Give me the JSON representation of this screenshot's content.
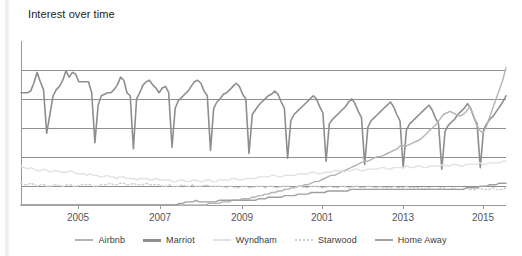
{
  "panel": {
    "title": "Interest over time",
    "background": "#ffffff"
  },
  "legend": {
    "position": "bottom-center",
    "items": [
      {
        "label": "Airbnb",
        "color": "#b4b4b4",
        "style": "solid",
        "width": 2.5,
        "swatch_name": "legend-swatch-airbnb"
      },
      {
        "label": "Marriot",
        "color": "#8e8e8e",
        "style": "solid",
        "width": 3.0,
        "swatch_name": "legend-swatch-marriot"
      },
      {
        "label": "Wyndham",
        "color": "#e2e2e2",
        "style": "solid",
        "width": 2.5,
        "swatch_name": "legend-swatch-wyndham"
      },
      {
        "label": "Starwood",
        "color": "#cfcfcf",
        "style": "dotted",
        "width": 2.5,
        "swatch_name": "legend-swatch-starwood"
      },
      {
        "label": "Home Away",
        "color": "#9f9f9f",
        "style": "solid",
        "width": 2.5,
        "swatch_name": "legend-swatch-homeaway"
      }
    ]
  },
  "axis": {
    "x_tick_labels": [
      "2005",
      "2007",
      "2009",
      "2001",
      "2013",
      "2015"
    ],
    "x_tick_positions": [
      78,
      160,
      242,
      322,
      403,
      483
    ],
    "gridlines_y": [
      70,
      99,
      128,
      157,
      186
    ],
    "baseline_y": 205,
    "axis_color": "#9a9a9a",
    "grid_color": "#8f8f8f"
  },
  "chart_data": {
    "type": "line",
    "title": "Interest over time",
    "xlabel": "",
    "ylabel": "",
    "grid": true,
    "legend_position": "bottom",
    "ylim": [
      0,
      100
    ],
    "xlim": [
      "2004",
      "2016"
    ],
    "x_tick_labels": [
      "2005",
      "2007",
      "2009",
      "2001",
      "2013",
      "2015"
    ],
    "series": [
      {
        "name": "Marriot",
        "color": "#8e8e8e",
        "style": "solid",
        "values": [
          72,
          72,
          72,
          73,
          78,
          85,
          79,
          74,
          46,
          58,
          70,
          74,
          76,
          80,
          86,
          82,
          85,
          84,
          79,
          79,
          79,
          79,
          72,
          40,
          64,
          70,
          71,
          72,
          72,
          74,
          77,
          82,
          80,
          72,
          70,
          36,
          68,
          72,
          77,
          79,
          80,
          77,
          75,
          72,
          75,
          76,
          72,
          37,
          62,
          67,
          69,
          71,
          73,
          76,
          79,
          80,
          78,
          73,
          70,
          35,
          62,
          66,
          68,
          71,
          72,
          74,
          76,
          78,
          76,
          71,
          68,
          33,
          58,
          61,
          64,
          66,
          68,
          70,
          71,
          73,
          71,
          66,
          62,
          30,
          54,
          58,
          60,
          62,
          64,
          66,
          68,
          70,
          68,
          63,
          59,
          28,
          52,
          55,
          57,
          59,
          61,
          63,
          66,
          68,
          65,
          60,
          56,
          26,
          50,
          54,
          56,
          58,
          60,
          62,
          64,
          66,
          63,
          58,
          54,
          24,
          48,
          52,
          54,
          56,
          58,
          60,
          62,
          64,
          61,
          56,
          52,
          23,
          47,
          51,
          53,
          55,
          58,
          60,
          62,
          65,
          62,
          56,
          52,
          24,
          48,
          52,
          55,
          57,
          60,
          63,
          66,
          70
        ]
      },
      {
        "name": "Airbnb",
        "color": "#b4b4b4",
        "style": "solid",
        "values": [
          0,
          0,
          0,
          0,
          0,
          0,
          0,
          0,
          0,
          0,
          0,
          0,
          0,
          0,
          0,
          0,
          0,
          0,
          0,
          0,
          0,
          0,
          0,
          0,
          0,
          0,
          0,
          0,
          0,
          0,
          0,
          0,
          0,
          0,
          0,
          0,
          0,
          0,
          0,
          0,
          0,
          0,
          0,
          0,
          0,
          0,
          0,
          0,
          0,
          0,
          0,
          0,
          0,
          0,
          0,
          0,
          0,
          1,
          1,
          1,
          1,
          2,
          2,
          2,
          3,
          3,
          3,
          4,
          4,
          4,
          5,
          5,
          6,
          6,
          7,
          7,
          8,
          8,
          9,
          9,
          10,
          10,
          11,
          11,
          12,
          12,
          13,
          13,
          14,
          15,
          15,
          16,
          17,
          18,
          19,
          19,
          20,
          21,
          22,
          23,
          24,
          25,
          26,
          27,
          28,
          28,
          29,
          30,
          31,
          31,
          32,
          33,
          34,
          35,
          36,
          38,
          38,
          38,
          39,
          40,
          41,
          42,
          44,
          46,
          48,
          50,
          52,
          55,
          58,
          59,
          60,
          59,
          58,
          57,
          58,
          60,
          63,
          58,
          52,
          48,
          46,
          50,
          56,
          62,
          68,
          74,
          80,
          88
        ]
      },
      {
        "name": "Wyndham",
        "color": "#e2e2e2",
        "style": "solid",
        "values": [
          25,
          24,
          23,
          24,
          23,
          22,
          22,
          23,
          22,
          21,
          22,
          22,
          21,
          21,
          21,
          22,
          21,
          20,
          20,
          20,
          19,
          20,
          19,
          19,
          18,
          18,
          19,
          18,
          18,
          17,
          18,
          18,
          17,
          17,
          17,
          16,
          17,
          17,
          17,
          16,
          16,
          17,
          16,
          16,
          16,
          16,
          15,
          15,
          16,
          16,
          15,
          15,
          16,
          16,
          15,
          15,
          16,
          16,
          15,
          15,
          16,
          16,
          16,
          16,
          17,
          17,
          16,
          16,
          17,
          17,
          17,
          17,
          18,
          18,
          18,
          18,
          19,
          19,
          18,
          18,
          19,
          19,
          19,
          19,
          20,
          20,
          20,
          20,
          21,
          21,
          20,
          20,
          21,
          21,
          21,
          22,
          22,
          22,
          21,
          22,
          22,
          23,
          23,
          22,
          22,
          23,
          23,
          23,
          23,
          24,
          24,
          23,
          23,
          24,
          24,
          24,
          24,
          25,
          24,
          24,
          25,
          25,
          24,
          24,
          25,
          25,
          25,
          25,
          26,
          25,
          25,
          26,
          26,
          25,
          25,
          26,
          26,
          26,
          26,
          27,
          26,
          26,
          27,
          27,
          27,
          27,
          28,
          28
        ]
      },
      {
        "name": "Starwood",
        "color": "#cfcfcf",
        "style": "dotted",
        "values": [
          14,
          13,
          13,
          14,
          13,
          12,
          13,
          13,
          12,
          12,
          13,
          13,
          12,
          12,
          13,
          13,
          12,
          12,
          13,
          13,
          13,
          13,
          12,
          12,
          13,
          13,
          13,
          14,
          13,
          13,
          14,
          14,
          13,
          13,
          14,
          13,
          13,
          13,
          14,
          13,
          13,
          13,
          13,
          12,
          12,
          13,
          12,
          12,
          12,
          13,
          12,
          12,
          13,
          12,
          12,
          12,
          13,
          12,
          12,
          12,
          12,
          12,
          11,
          12,
          12,
          11,
          11,
          12,
          12,
          11,
          11,
          12,
          12,
          12,
          11,
          12,
          12,
          11,
          11,
          12,
          12,
          12,
          11,
          11,
          12,
          12,
          11,
          11,
          12,
          12,
          12,
          11,
          11,
          12,
          12,
          11,
          11,
          12,
          12,
          11,
          11,
          12,
          12,
          11,
          11,
          12,
          12,
          11,
          11,
          12,
          11,
          11,
          11,
          12,
          11,
          11,
          11,
          12,
          11,
          11,
          11,
          11,
          10,
          11,
          11,
          10,
          10,
          11,
          11,
          10,
          10,
          11,
          10,
          10,
          10,
          11,
          10,
          10,
          10,
          11,
          10,
          10,
          10,
          11,
          10,
          10,
          10,
          11
        ]
      },
      {
        "name": "Home Away",
        "color": "#9f9f9f",
        "style": "solid",
        "values": [
          0,
          0,
          0,
          0,
          0,
          0,
          0,
          0,
          0,
          0,
          0,
          0,
          0,
          0,
          0,
          0,
          0,
          0,
          0,
          0,
          0,
          0,
          0,
          0,
          0,
          0,
          0,
          0,
          0,
          0,
          0,
          0,
          0,
          0,
          0,
          0,
          0,
          0,
          0,
          0,
          0,
          0,
          0,
          0,
          0,
          0,
          0,
          0,
          1,
          1,
          2,
          2,
          2,
          3,
          2,
          2,
          2,
          2,
          2,
          2,
          3,
          3,
          3,
          3,
          3,
          3,
          3,
          3,
          3,
          3,
          3,
          3,
          4,
          4,
          4,
          5,
          5,
          5,
          5,
          5,
          6,
          6,
          6,
          6,
          7,
          7,
          7,
          7,
          8,
          8,
          8,
          8,
          8,
          9,
          9,
          9,
          9,
          9,
          9,
          9,
          10,
          10,
          10,
          10,
          10,
          10,
          10,
          10,
          10,
          10,
          10,
          10,
          10,
          10,
          10,
          10,
          10,
          10,
          10,
          10,
          10,
          10,
          10,
          10,
          10,
          10,
          10,
          10,
          10,
          10,
          10,
          10,
          10,
          10,
          10,
          11,
          11,
          11,
          11,
          12,
          12,
          12,
          13,
          13,
          13,
          14,
          14,
          14
        ]
      }
    ]
  }
}
